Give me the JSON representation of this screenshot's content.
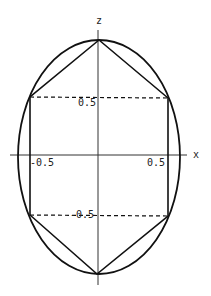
{
  "diagram": {
    "axes": {
      "x_label": "x",
      "z_label": "z"
    },
    "ticks": {
      "x_neg": "-0.5",
      "x_pos": "0.5",
      "z_pos": "0.5",
      "z_neg": "-0.5"
    },
    "shapes": [
      "ellipse",
      "hexagon inscribed",
      "dashed horizontal lines at z=±0.5"
    ]
  }
}
